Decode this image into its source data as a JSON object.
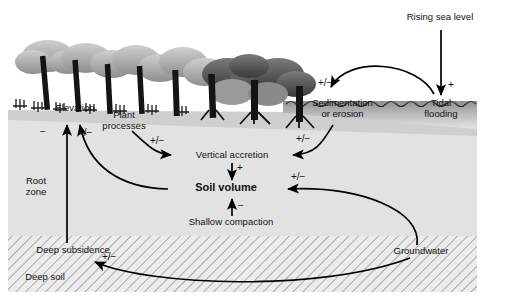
{
  "figure": {
    "domain": "Diagram"
  },
  "zones": [
    {
      "id": "water",
      "label": "Tidal water column"
    },
    {
      "id": "root_zone",
      "label": "Root zone"
    },
    {
      "id": "deep_soil",
      "label": "Deep soil"
    }
  ],
  "nodes": [
    {
      "id": "rising_sea_level",
      "label": "Rising sea level",
      "x": 440,
      "y": 18,
      "align": "center",
      "bold": false
    },
    {
      "id": "tidal_flooding",
      "label": "Tidal\nflooding",
      "x": 441,
      "y": 104,
      "align": "center",
      "bold": false
    },
    {
      "id": "sedimentation",
      "label": "Sedimentation\nor erosion",
      "x": 342,
      "y": 104,
      "align": "center",
      "bold": false
    },
    {
      "id": "elevation",
      "label": "Elevation",
      "x": 74,
      "y": 108,
      "align": "center",
      "bold": false
    },
    {
      "id": "plant_processes",
      "label": "Plant\nprocesses",
      "x": 124,
      "y": 115,
      "align": "center",
      "bold": false
    },
    {
      "id": "vertical_accretion",
      "label": "Vertical accretion",
      "x": 232,
      "y": 155,
      "align": "center",
      "bold": false
    },
    {
      "id": "soil_volume",
      "label": "Soil volume",
      "x": 225,
      "y": 189,
      "align": "center",
      "bold": true
    },
    {
      "id": "shallow_compaction",
      "label": "Shallow compaction",
      "x": 230,
      "y": 222,
      "align": "center",
      "bold": false
    },
    {
      "id": "root_zone",
      "label": "Root\nzone",
      "x": 35,
      "y": 183,
      "align": "center",
      "bold": false
    },
    {
      "id": "deep_subsidence",
      "label": "Deep subsidence",
      "x": 72,
      "y": 251,
      "align": "center",
      "bold": false
    },
    {
      "id": "deep_soil",
      "label": "Deep soil",
      "x": 42,
      "y": 278,
      "align": "center",
      "bold": false
    },
    {
      "id": "groundwater",
      "label": "Groundwater",
      "x": 419,
      "y": 252,
      "align": "center",
      "bold": false
    }
  ],
  "edges": [
    {
      "id": "sealevel-to-tidal",
      "from": "rising_sea_level",
      "to": "tidal_flooding",
      "sign": "+",
      "sign_x": 450,
      "sign_y": 86
    },
    {
      "id": "tidal-to-sedimentation",
      "from": "tidal_flooding",
      "to": "sedimentation",
      "sign": "+/−",
      "sign_x": 325,
      "sign_y": 84
    },
    {
      "id": "sedimentation-to-accretion",
      "from": "sedimentation",
      "to": "vertical_accretion",
      "sign": "+/−",
      "sign_x": 300,
      "sign_y": 144
    },
    {
      "id": "plant-to-accretion",
      "from": "plant_processes",
      "to": "vertical_accretion",
      "sign": "+/−",
      "sign_x": 156,
      "sign_y": 144
    },
    {
      "id": "accretion-to-soilvolume",
      "from": "vertical_accretion",
      "to": "soil_volume",
      "sign": "+",
      "sign_x": 239,
      "sign_y": 168
    },
    {
      "id": "compaction-to-soilvolume",
      "from": "shallow_compaction",
      "to": "soil_volume",
      "sign": "−",
      "sign_x": 238,
      "sign_y": 203
    },
    {
      "id": "groundwater-to-soilvolume",
      "from": "groundwater",
      "to": "soil_volume",
      "sign": "+/−",
      "sign_x": 296,
      "sign_y": 178
    },
    {
      "id": "soilvolume-to-elevation",
      "from": "soil_volume",
      "to": "elevation",
      "sign": "+/−",
      "sign_x": 85,
      "sign_y": 133
    },
    {
      "id": "subsidence-to-elevation",
      "from": "deep_subsidence",
      "to": "elevation",
      "sign": "−",
      "sign_x": 44,
      "sign_y": 133
    },
    {
      "id": "groundwater-to-subsidence",
      "from": "groundwater",
      "to": "deep_subsidence",
      "sign": "+/−",
      "sign_x": 110,
      "sign_y": 257
    }
  ],
  "colors": {
    "root_zone_fill": "#e2e2e2",
    "deep_soil_fill": "#ececec",
    "hatch_stroke": "#9a9a9a",
    "water_dark": "#6e6e6e",
    "water_light": "#dcdcdc",
    "marsh_surface": "#d9d9d9",
    "trunk": "#1a1a1a",
    "canopy_light": "#bdbdbd",
    "canopy_dark": "#4a4a4a",
    "arrow": "#000000",
    "text": "#111111"
  }
}
